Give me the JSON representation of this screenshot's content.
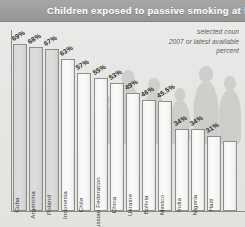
{
  "header": {
    "title": "Children exposed to passive smoking at ho",
    "title_full": "Children exposed to passive smoking at home"
  },
  "subtitle": {
    "line1": "selected coun",
    "line2": "2007 or latest available",
    "line3": "percent"
  },
  "colors": {
    "title_bar": "#9d9d9b",
    "title_text": "#ffffff",
    "page_background": "#e6e6e3",
    "bar_fill": "#f7f7f5",
    "bar_fill_shaded": "#d7d7d4",
    "bar_border": "#8f8f8d",
    "axis": "#8d8d8b",
    "label_text": "#3a3a38",
    "subtitle_text": "#5c5c5a"
  },
  "chart_data": {
    "type": "bar",
    "subtitle": "selected countries, 2007 or latest available, percent",
    "xlabel": "",
    "ylabel": "percent",
    "ylim": [
      0,
      75
    ],
    "grid": false,
    "legend": false,
    "value_suffix": "%",
    "categories": [
      "Cuba",
      "Argentina",
      "Poland",
      "Indonesia",
      "Chile",
      "Russian Federation",
      "China",
      "Ukraine",
      "Bolivia",
      "Mexico",
      "India",
      "Nigeria",
      "Haiti"
    ],
    "values": [
      69,
      68,
      67,
      63,
      57,
      55,
      53,
      49,
      46,
      45.5,
      34,
      34,
      31
    ],
    "value_labels": [
      "69%",
      "68%",
      "67%",
      "63%",
      "57%",
      "55%",
      "53%",
      "49%",
      "46%",
      "45.5%",
      "34%",
      "34%",
      "31%"
    ],
    "truncated_right_bar": true
  }
}
